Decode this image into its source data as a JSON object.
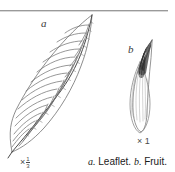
{
  "figure": {
    "background_color": "#ffffff",
    "ink_color": "#555555",
    "rule_color": "#9a9a9a",
    "caption": {
      "part_a_letter": "a.",
      "part_a_text": "Leaflet.",
      "part_b_letter": "b.",
      "part_b_text": "Fruit."
    },
    "labels": {
      "leaf": "a",
      "fruit": "b"
    },
    "scales": {
      "leaf_prefix": "×",
      "leaf_numerator": "1",
      "leaf_denominator": "3",
      "fruit": "× 1"
    },
    "specimens": [
      {
        "name": "leaflet",
        "letter": "a",
        "description": "Elongate lanceolate leaflet with acuminate apex, serrate margin and pinnate parallel secondary veins",
        "magnification": "× 1/3"
      },
      {
        "name": "fruit",
        "letter": "b",
        "description": "Narrow elongate fruit with dark beaked apex and fine longitudinal striations",
        "magnification": "× 1"
      }
    ]
  }
}
